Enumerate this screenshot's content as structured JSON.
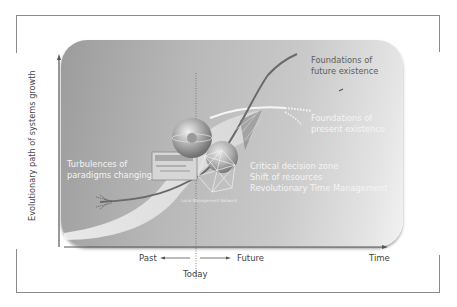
{
  "diagram": {
    "y_axis_label": "Evolutionary path of systems growth",
    "x_axis": {
      "past_label": "Past",
      "future_label": "Future",
      "today_label": "Today",
      "time_label": "Time"
    },
    "annotations": {
      "future_foundations": [
        "Foundations of",
        "future existence"
      ],
      "present_foundations": [
        "Foundations of",
        "present existence"
      ],
      "turbulences": [
        "Turbulences of",
        "paradigms changing"
      ],
      "decision_zone": [
        "Critical decision zone",
        "Shift of resources",
        "Revolutionary Time Management"
      ],
      "network_caption": "Local Management Network"
    },
    "colors": {
      "panel_dark": "#9c9c9c",
      "panel_light": "#f2f2f2",
      "curve": "#6a6a6a",
      "present_curve": "#f4f4f4",
      "frame": "#8a8a8a"
    }
  }
}
